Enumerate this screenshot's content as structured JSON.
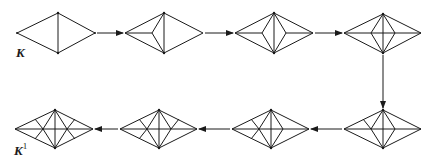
{
  "diagram": {
    "labels": {
      "start": "K",
      "end_base": "K",
      "end_sup": "1"
    },
    "colors": {
      "stroke": "#1a1a1a",
      "background": "#ffffff"
    },
    "stages": [
      {
        "index": 1,
        "row": "top",
        "description": "Diamond with vertical edge"
      },
      {
        "index": 2,
        "row": "top",
        "description": "Left triangle subdivided at interior point"
      },
      {
        "index": 3,
        "row": "top",
        "description": "Both triangles subdivided (inner diamond)"
      },
      {
        "index": 4,
        "row": "top",
        "description": "Horizontal diagonal added"
      },
      {
        "index": 5,
        "row": "bottom",
        "description": "Upper-left edge subdivided"
      },
      {
        "index": 6,
        "row": "bottom",
        "description": "Lower-left edge subdivided"
      },
      {
        "index": 7,
        "row": "bottom",
        "description": "Upper-right edge subdivided"
      },
      {
        "index": 8,
        "row": "bottom",
        "description": "Lower-right edge subdivided (K1)"
      }
    ],
    "arrows": [
      {
        "from": 1,
        "to": 2,
        "direction": "right"
      },
      {
        "from": 2,
        "to": 3,
        "direction": "right"
      },
      {
        "from": 3,
        "to": 4,
        "direction": "right"
      },
      {
        "from": 4,
        "to": 5,
        "direction": "down"
      },
      {
        "from": 5,
        "to": 6,
        "direction": "left"
      },
      {
        "from": 6,
        "to": 7,
        "direction": "left"
      },
      {
        "from": 7,
        "to": 8,
        "direction": "left"
      }
    ]
  }
}
